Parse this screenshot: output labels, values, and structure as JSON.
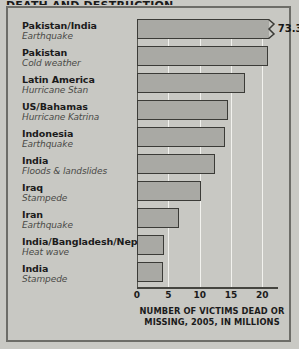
{
  "figure": {
    "title_sliver": "DEATH AND DESTRUCTION",
    "frame_color": "#6d6d68",
    "background_color": "#c9c9c4",
    "bar_fill_color": "#a9a9a4",
    "bar_border_color": "#3b3b37",
    "gridline_color": "#f2f2ee"
  },
  "chart_data": {
    "type": "bar",
    "orientation": "horizontal",
    "title": "DEATH AND DESTRUCTION",
    "xlabel": "NUMBER OF VICTIMS DEAD OR MISSING, 2005, IN MILLIONS",
    "xlabel_line1": "NUMBER OF VICTIMS DEAD OR",
    "xlabel_line2": "MISSING, 2005, IN MILLIONS",
    "ylabel": "",
    "xlim": [
      0,
      22.5
    ],
    "xticks": [
      0,
      5,
      10,
      15,
      20
    ],
    "xtick_labels": [
      "0",
      "5",
      "10",
      "15",
      "20"
    ],
    "grid": true,
    "legend": null,
    "axis_break": {
      "present": true,
      "series_index": 0,
      "note": "First bar is truncated with a zigzag break; true value shown as data label."
    },
    "categories": [
      "Pakistan/India",
      "Pakistan",
      "Latin America",
      "US/Bahamas",
      "Indonesia",
      "India",
      "Iraq",
      "Iran",
      "India/Bangladesh/Nepal",
      "India"
    ],
    "subcategories": [
      "Earthquake",
      "Cold weather",
      "Hurricane Stan",
      "Hurricane Katrina",
      "Earthquake",
      "Floods & landslides",
      "Stampede",
      "Earthquake",
      "Heat wave",
      "Stampede"
    ],
    "values": [
      73.3,
      20.9,
      17.3,
      14.5,
      14.0,
      12.5,
      10.2,
      6.7,
      4.3,
      4.2
    ],
    "value_labels": [
      "73.3",
      "",
      "",
      "",
      "",
      "",
      "",
      "",
      "",
      ""
    ],
    "bars": [
      {
        "country": "Pakistan/India",
        "cause": "Earthquake",
        "value": 73.3,
        "plotted": 22.0,
        "broken": true,
        "label": "73.3"
      },
      {
        "country": "Pakistan",
        "cause": "Cold weather",
        "value": 20.9,
        "plotted": 20.9,
        "broken": false,
        "label": ""
      },
      {
        "country": "Latin America",
        "cause": "Hurricane Stan",
        "value": 17.3,
        "plotted": 17.3,
        "broken": false,
        "label": ""
      },
      {
        "country": "US/Bahamas",
        "cause": "Hurricane Katrina",
        "value": 14.5,
        "plotted": 14.5,
        "broken": false,
        "label": ""
      },
      {
        "country": "Indonesia",
        "cause": "Earthquake",
        "value": 14.0,
        "plotted": 14.0,
        "broken": false,
        "label": ""
      },
      {
        "country": "India",
        "cause": "Floods & landslides",
        "value": 12.5,
        "plotted": 12.5,
        "broken": false,
        "label": ""
      },
      {
        "country": "Iraq",
        "cause": "Stampede",
        "value": 10.2,
        "plotted": 10.2,
        "broken": false,
        "label": ""
      },
      {
        "country": "Iran",
        "cause": "Earthquake",
        "value": 6.7,
        "plotted": 6.7,
        "broken": false,
        "label": ""
      },
      {
        "country": "India/Bangladesh/Nepal",
        "cause": "Heat wave",
        "value": 4.3,
        "plotted": 4.3,
        "broken": false,
        "label": ""
      },
      {
        "country": "India",
        "cause": "Stampede",
        "value": 4.2,
        "plotted": 4.2,
        "broken": false,
        "label": ""
      }
    ]
  }
}
